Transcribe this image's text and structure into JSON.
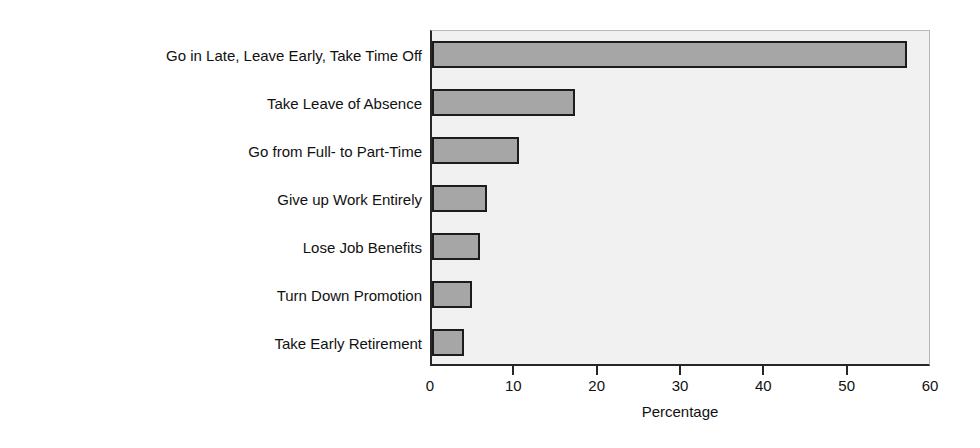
{
  "chart_data": {
    "type": "bar",
    "orientation": "horizontal",
    "title": "",
    "subtitle": "",
    "xlabel": "Percentage",
    "ylabel": "",
    "xlim": [
      0,
      60
    ],
    "xticks": [
      0,
      10,
      20,
      30,
      40,
      50,
      60
    ],
    "xtick_labels": [
      "0",
      "10",
      "20",
      "30",
      "40",
      "50",
      "60"
    ],
    "grid": false,
    "legend": null,
    "categories": [
      "Go in Late, Leave Early, Take Time Off",
      "Take Leave of Absence",
      "Go from Full- to Part-Time",
      "Give up Work Entirely",
      "Lose Job Benefits",
      "Turn Down Promotion",
      "Take Early Retirement"
    ],
    "values": [
      57,
      17.2,
      10.4,
      6.6,
      5.7,
      4.8,
      3.8
    ],
    "annotations": []
  },
  "style": {
    "bar_fill": "#a6a6a6",
    "bar_edge": "#1c1c1c",
    "plot_background": "#f1f1f1",
    "axis_color": "#262626",
    "text_color": "#111111",
    "page_background": "#ffffff"
  }
}
